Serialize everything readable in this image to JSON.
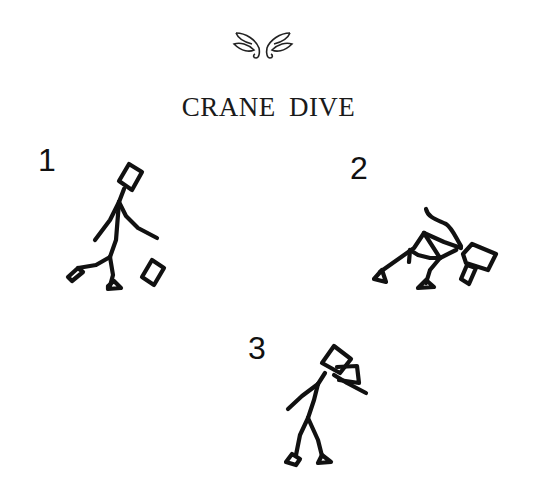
{
  "title": "CRANE DIVE",
  "ornament": "fleuron-ornament",
  "figures": [
    {
      "label": "1",
      "pose": "walking-with-block"
    },
    {
      "label": "2",
      "pose": "bent-over-diving"
    },
    {
      "label": "3",
      "pose": "standing-with-hat"
    }
  ]
}
